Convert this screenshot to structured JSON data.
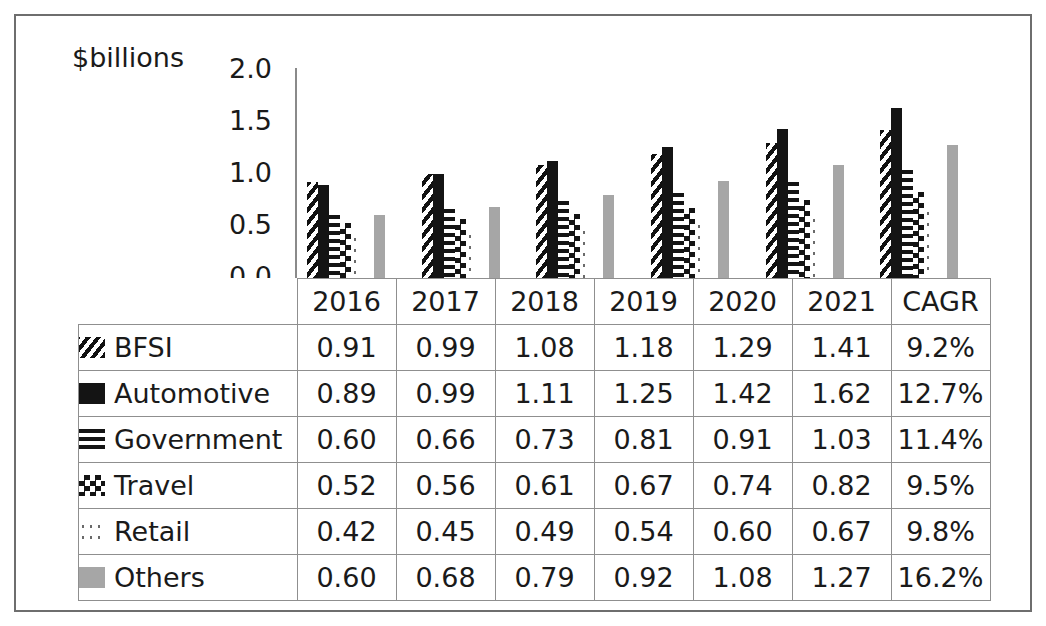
{
  "chart_data": {
    "type": "bar",
    "title": "",
    "subtitle": "",
    "xlabel": "",
    "ylabel": "$billions",
    "ylim": [
      0.0,
      2.0
    ],
    "yticks": [
      "2.0",
      "1.5",
      "1.0",
      "0.5",
      "0.0"
    ],
    "ytick_values": [
      2.0,
      1.5,
      1.0,
      0.5,
      0.0
    ],
    "grid": false,
    "legend_position": "table-left-column",
    "categories": [
      "2016",
      "2017",
      "2018",
      "2019",
      "2020",
      "2021"
    ],
    "series": [
      {
        "name": "BFSI",
        "pattern": "diagonal-stripe",
        "color": "#141414",
        "values": [
          0.91,
          0.99,
          1.08,
          1.18,
          1.29,
          1.41
        ],
        "cagr": "9.2%"
      },
      {
        "name": "Automotive",
        "pattern": "solid-black",
        "color": "#141414",
        "values": [
          0.89,
          0.99,
          1.11,
          1.25,
          1.42,
          1.62
        ],
        "cagr": "12.7%"
      },
      {
        "name": "Government",
        "pattern": "horizontal-lines",
        "color": "#141414",
        "values": [
          0.6,
          0.66,
          0.73,
          0.81,
          0.91,
          1.03
        ],
        "cagr": "11.4%"
      },
      {
        "name": "Travel",
        "pattern": "checkerboard",
        "color": "#141414",
        "values": [
          0.52,
          0.56,
          0.61,
          0.67,
          0.74,
          0.82
        ],
        "cagr": "9.5%"
      },
      {
        "name": "Retail",
        "pattern": "sparse-dots",
        "color": "#6a6a6a",
        "values": [
          0.42,
          0.45,
          0.49,
          0.54,
          0.6,
          0.67
        ],
        "cagr": "9.8%"
      },
      {
        "name": "Others",
        "pattern": "solid-gray",
        "color": "#a6a6a6",
        "values": [
          0.6,
          0.68,
          0.79,
          0.92,
          1.08,
          1.27
        ],
        "cagr": "16.2%"
      }
    ]
  },
  "chart": {
    "axis_title": "$billions",
    "yticks": [
      "2.0",
      "1.5",
      "1.0",
      "0.5",
      "0.0"
    ]
  },
  "table": {
    "columns": [
      "2016",
      "2017",
      "2018",
      "2019",
      "2020",
      "2021",
      "CAGR"
    ],
    "rows": [
      {
        "label": "BFSI",
        "swatch": "diagonal-stripe-swatch",
        "cells": [
          "0.91",
          "0.99",
          "1.08",
          "1.18",
          "1.29",
          "1.41",
          "9.2%"
        ]
      },
      {
        "label": "Automotive",
        "swatch": "solid-black-swatch",
        "cells": [
          "0.89",
          "0.99",
          "1.11",
          "1.25",
          "1.42",
          "1.62",
          "12.7%"
        ]
      },
      {
        "label": "Government",
        "swatch": "horizontal-lines-swatch",
        "cells": [
          "0.60",
          "0.66",
          "0.73",
          "0.81",
          "0.91",
          "1.03",
          "11.4%"
        ]
      },
      {
        "label": "Travel",
        "swatch": "checkerboard-swatch",
        "cells": [
          "0.52",
          "0.56",
          "0.61",
          "0.67",
          "0.74",
          "0.82",
          "9.5%"
        ]
      },
      {
        "label": "Retail",
        "swatch": "sparse-dots-swatch",
        "cells": [
          "0.42",
          "0.45",
          "0.49",
          "0.54",
          "0.60",
          "0.67",
          "9.8%"
        ]
      },
      {
        "label": "Others",
        "swatch": "solid-gray-swatch",
        "cells": [
          "0.60",
          "0.68",
          "0.79",
          "0.92",
          "1.08",
          "1.27",
          "16.2%"
        ]
      }
    ]
  },
  "colors": {
    "frame": "#6e6e6e",
    "grid_line": "#8f8f8f",
    "axis_line": "#8a8a8a",
    "ink": "#141414",
    "gray_series": "#a6a6a6",
    "dot_gray": "#6a6a6a"
  }
}
